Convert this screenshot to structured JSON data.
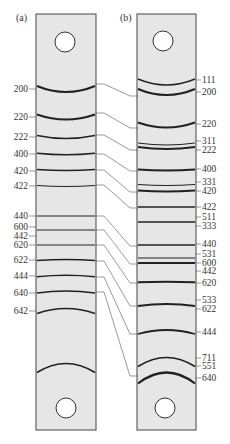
{
  "figure": {
    "panels": [
      {
        "id": "a",
        "label": "(a)"
      },
      {
        "id": "b",
        "label": "(b)"
      }
    ],
    "colors": {
      "strip_fill": "#e6e6e6",
      "strip_border": "#444444",
      "line": "#222222",
      "connector": "#555555",
      "text": "#333333"
    },
    "strip_a": {
      "lines": [
        {
          "hkl": "200",
          "y": 89,
          "sag": 6,
          "w": 2.2
        },
        {
          "hkl": "220",
          "y": 117,
          "sag": 5,
          "w": 2.0
        },
        {
          "hkl": "222",
          "y": 137,
          "sag": 3,
          "w": 1.4
        },
        {
          "hkl": "400",
          "y": 154,
          "sag": 1.5,
          "w": 1.4
        },
        {
          "hkl": "420",
          "y": 170,
          "sag": 1,
          "w": 1.4
        },
        {
          "hkl": "422",
          "y": 186,
          "sag": 1,
          "w": 1.2
        },
        {
          "hkl": "440",
          "y": 216,
          "sag": 0,
          "w": 1.2
        },
        {
          "hkl": "600 / 442",
          "y": 230,
          "sag": 0,
          "w": 1.2
        },
        {
          "hkl": "620",
          "y": 245,
          "sag": 0,
          "w": 1.2
        },
        {
          "hkl": "622",
          "y": 260,
          "sag": -1,
          "w": 1.6
        },
        {
          "hkl": "444",
          "y": 276,
          "sag": -1.5,
          "w": 1.6
        },
        {
          "hkl": "640",
          "y": 292,
          "sag": -2,
          "w": 1.6
        },
        {
          "hkl": "642",
          "y": 311,
          "sag": -5,
          "w": 1.6
        }
      ],
      "labels": [
        {
          "text": "200",
          "y": 89
        },
        {
          "text": "220",
          "y": 117
        },
        {
          "text": "222",
          "y": 137
        },
        {
          "text": "400",
          "y": 154
        },
        {
          "text": "420",
          "y": 171
        },
        {
          "text": "422",
          "y": 186
        },
        {
          "text": "440",
          "y": 216
        },
        {
          "text": "600",
          "y": 227
        },
        {
          "text": "442",
          "y": 236
        },
        {
          "text": "620",
          "y": 245
        },
        {
          "text": "622",
          "y": 260
        },
        {
          "text": "444",
          "y": 276
        },
        {
          "text": "640",
          "y": 293
        },
        {
          "text": "642",
          "y": 311
        }
      ],
      "bottom_arc": {
        "y": 368,
        "sag": -9
      }
    },
    "strip_b": {
      "lines": [
        {
          "hkl": "111",
          "y": 82,
          "sag": 6,
          "w": 1.4
        },
        {
          "hkl": "200",
          "y": 92,
          "sag": 6,
          "w": 2.2
        },
        {
          "hkl": "220",
          "y": 125,
          "sag": 5,
          "w": 2.2
        },
        {
          "hkl": "311",
          "y": 144,
          "sag": 2,
          "w": 1.2
        },
        {
          "hkl": "222",
          "y": 148,
          "sag": 2,
          "w": 2.0
        },
        {
          "hkl": "400",
          "y": 170,
          "sag": 1,
          "w": 2.0
        },
        {
          "hkl": "331",
          "y": 185,
          "sag": 1,
          "w": 1.2
        },
        {
          "hkl": "420",
          "y": 191,
          "sag": 1,
          "w": 1.8
        },
        {
          "hkl": "422",
          "y": 207,
          "sag": 0,
          "w": 1.6
        },
        {
          "hkl": "511 / 333",
          "y": 222,
          "sag": 0,
          "w": 1.4
        },
        {
          "hkl": "440",
          "y": 245,
          "sag": 0,
          "w": 1.4
        },
        {
          "hkl": "531",
          "y": 258,
          "sag": 0,
          "w": 1.0
        },
        {
          "hkl": "600 / 442",
          "y": 263,
          "sag": 0,
          "w": 1.8
        },
        {
          "hkl": "620",
          "y": 282,
          "sag": -0.5,
          "w": 1.8
        },
        {
          "hkl": "533 / 622",
          "y": 305,
          "sag": -2,
          "w": 1.8
        },
        {
          "hkl": "444",
          "y": 332,
          "sag": -4,
          "w": 1.8
        },
        {
          "hkl": "711 / 551",
          "y": 362,
          "sag": -9,
          "w": 1.6
        },
        {
          "hkl": "640",
          "y": 378,
          "sag": -11,
          "w": 2.2
        }
      ],
      "labels": [
        {
          "text": "111",
          "y": 80
        },
        {
          "text": "200",
          "y": 92
        },
        {
          "text": "220",
          "y": 124
        },
        {
          "text": "311",
          "y": 141
        },
        {
          "text": "222",
          "y": 150
        },
        {
          "text": "400",
          "y": 169
        },
        {
          "text": "331",
          "y": 182
        },
        {
          "text": "420",
          "y": 191
        },
        {
          "text": "422",
          "y": 207
        },
        {
          "text": "511",
          "y": 217
        },
        {
          "text": "333",
          "y": 226
        },
        {
          "text": "440",
          "y": 244
        },
        {
          "text": "531",
          "y": 254
        },
        {
          "text": "600",
          "y": 263
        },
        {
          "text": "442",
          "y": 271
        },
        {
          "text": "620",
          "y": 283
        },
        {
          "text": "533",
          "y": 300
        },
        {
          "text": "622",
          "y": 309
        },
        {
          "text": "444",
          "y": 332
        },
        {
          "text": "711",
          "y": 358
        },
        {
          "text": "551",
          "y": 366
        },
        {
          "text": "640",
          "y": 378
        }
      ]
    },
    "connectors": [
      {
        "from_y": 84,
        "to_y": 96,
        "hkl": "200"
      },
      {
        "from_y": 113,
        "to_y": 128,
        "hkl": "220"
      },
      {
        "from_y": 135,
        "to_y": 150,
        "hkl": "222"
      },
      {
        "from_y": 154,
        "to_y": 171,
        "hkl": "400"
      },
      {
        "from_y": 170,
        "to_y": 192,
        "hkl": "420"
      },
      {
        "from_y": 185,
        "to_y": 208,
        "hkl": "422"
      },
      {
        "from_y": 216,
        "to_y": 246,
        "hkl": "440"
      },
      {
        "from_y": 230,
        "to_y": 264,
        "hkl": "600/442"
      },
      {
        "from_y": 245,
        "to_y": 283,
        "hkl": "620"
      },
      {
        "from_y": 261,
        "to_y": 306,
        "hkl": "622"
      },
      {
        "from_y": 277,
        "to_y": 334,
        "hkl": "444"
      },
      {
        "from_y": 292,
        "to_y": 376,
        "hkl": "640"
      }
    ]
  }
}
